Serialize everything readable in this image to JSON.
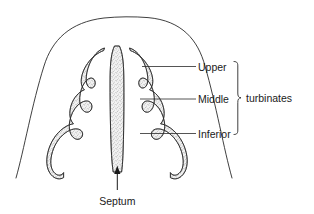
{
  "figure": {
    "background_color": "#ffffff",
    "ink_color": "#2a2a2a",
    "tissue_fill_color": "#e8e8e8",
    "stipple_dot_color": "#808080"
  },
  "labels": {
    "upper": "Upper",
    "middle": "Middle",
    "inferior": "Inferior",
    "group": "turbinates",
    "septum": "Septum"
  },
  "annotations": {
    "brace_name": "curly-brace",
    "arrow_name": "septum-pointer-arrow",
    "arrow_direction": "up"
  },
  "structures": [
    {
      "name": "head-outline",
      "label": ""
    },
    {
      "name": "nasal-septum",
      "label": "Septum"
    },
    {
      "name": "upper-turbinate-left",
      "label": "Upper"
    },
    {
      "name": "upper-turbinate-right",
      "label": "Upper"
    },
    {
      "name": "middle-turbinate-left",
      "label": "Middle"
    },
    {
      "name": "middle-turbinate-right",
      "label": "Middle"
    },
    {
      "name": "inferior-turbinate-left",
      "label": "Inferior"
    },
    {
      "name": "inferior-turbinate-right",
      "label": "Inferior"
    }
  ]
}
